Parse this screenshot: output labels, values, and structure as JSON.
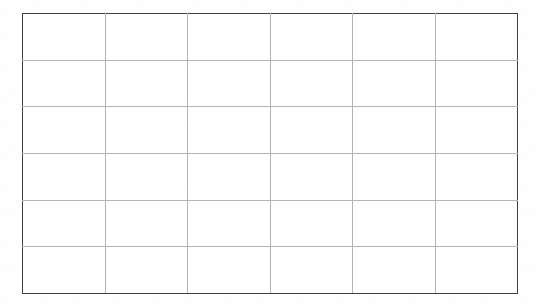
{
  "document": {
    "kind": "empty-table-grid",
    "background_color": "#fefefe",
    "page_width": 540,
    "page_height": 308
  },
  "table": {
    "border_color": "#3f3f3f",
    "gridline_color": "#b4b4b4",
    "cell_background": "#ffffff",
    "column_count": 6,
    "row_count": 6,
    "has_header_row": false,
    "columns": [
      "",
      "",
      "",
      "",
      "",
      ""
    ],
    "rows": [
      {
        "cells": [
          "",
          "",
          "",
          "",
          "",
          ""
        ]
      },
      {
        "cells": [
          "",
          "",
          "",
          "",
          "",
          ""
        ]
      },
      {
        "cells": [
          "",
          "",
          "",
          "",
          "",
          ""
        ]
      },
      {
        "cells": [
          "",
          "",
          "",
          "",
          "",
          ""
        ]
      },
      {
        "cells": [
          "",
          "",
          "",
          "",
          "",
          ""
        ]
      },
      {
        "cells": [
          "",
          "",
          "",
          "",
          "",
          ""
        ]
      }
    ]
  }
}
